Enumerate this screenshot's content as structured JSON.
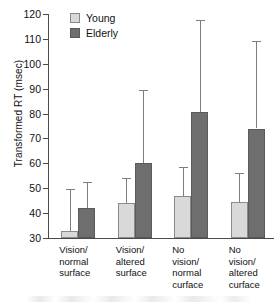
{
  "chart_data": {
    "type": "bar",
    "title": "",
    "xlabel": "",
    "ylabel": "Transformed RT (msec)",
    "ylim": [
      30,
      120
    ],
    "yticks": [
      30,
      40,
      50,
      60,
      70,
      80,
      90,
      100,
      110,
      120
    ],
    "ytick_labels": [
      "30",
      "40",
      "50",
      "60",
      "70",
      "80",
      "90",
      "100",
      "110",
      "120"
    ],
    "grid": false,
    "legend_position": "top-left-inside",
    "categories": [
      "Vision/\nnormal\nsurface",
      "Vision/\naltered\nsurface",
      "No\nvision/\nnormal\ncurface",
      "No\nvision/\naltered\ncurface"
    ],
    "series": [
      {
        "name": "Young",
        "color": "#d9d9d9",
        "values": [
          33,
          44,
          47,
          44.5
        ],
        "error_upper": [
          49.5,
          54,
          58.5,
          56
        ]
      },
      {
        "name": "Elderly",
        "color": "#6e6e6e",
        "values": [
          42,
          60,
          80.5,
          74
        ],
        "error_upper": [
          52.5,
          89.5,
          117.5,
          109
        ]
      }
    ],
    "errorbar_style": "upper-only-with-cap"
  },
  "legend": {
    "items": [
      {
        "label": "Young",
        "swatch": "light-gray-swatch"
      },
      {
        "label": "Elderly",
        "swatch": "dark-gray-swatch"
      }
    ]
  }
}
